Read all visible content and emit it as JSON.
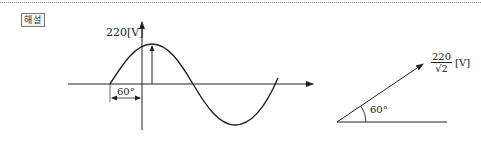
{
  "header": {
    "badge_label": "해설"
  },
  "waveform": {
    "peak_label": "220[V]",
    "phase_label": "60°"
  },
  "phasor": {
    "magnitude_numerator": "220",
    "magnitude_denominator": "√2",
    "unit": "[V]",
    "angle_label": "60°"
  },
  "colors": {
    "line": "#222222",
    "dotted_rule": "#888888"
  }
}
